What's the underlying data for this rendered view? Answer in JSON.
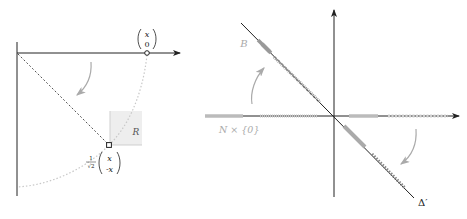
{
  "left_panel": {
    "point_top": {
      "top": "x",
      "bottom": "0"
    },
    "point_bottom": {
      "top": "x",
      "bottom": "-x"
    },
    "scale_factor": {
      "numerator": "1",
      "denominator": "√2"
    },
    "region_label": "R"
  },
  "right_panel": {
    "label_B": "B",
    "label_N": "N × {0}",
    "label_delta": "Δ′"
  },
  "colors": {
    "axis": "#222222",
    "light_gray": "#bdbdbd",
    "medium_gray": "#999999",
    "region_fill": "#ececec"
  }
}
